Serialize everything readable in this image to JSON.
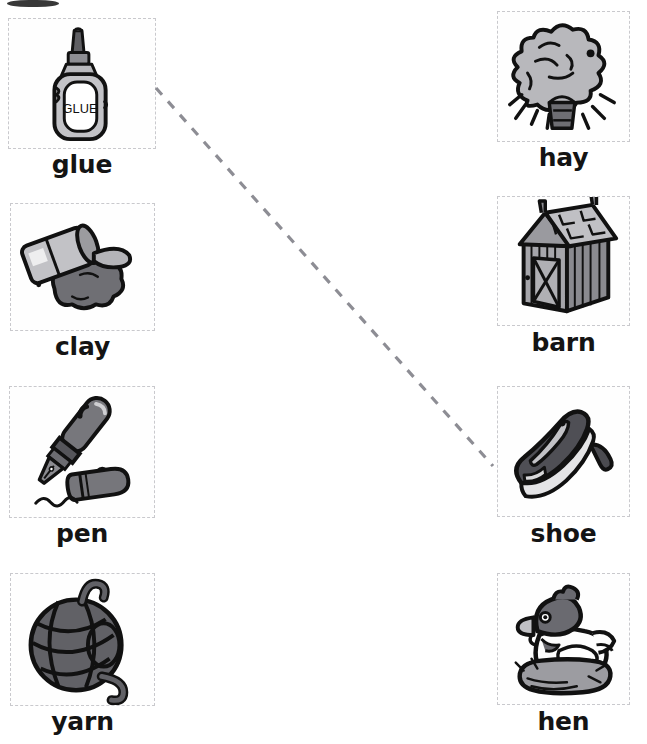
{
  "worksheet": {
    "title": "Matching worksheet: short vowel picture word match",
    "artifact": {
      "name": "scan-edge-artifact"
    },
    "columns": {
      "left": {
        "name": "left-column",
        "items": [
          {
            "word": "glue",
            "icon": "glue-bottle-icon",
            "box": {
              "x": 8,
              "y": 18,
              "w": 148,
              "h": 131
            },
            "label_y": 150
          },
          {
            "word": "clay",
            "icon": "clay-container-icon",
            "box": {
              "x": 10,
              "y": 203,
              "w": 145,
              "h": 128
            },
            "label_y": 332
          },
          {
            "word": "pen",
            "icon": "fountain-pen-icon",
            "box": {
              "x": 9,
              "y": 386,
              "w": 146,
              "h": 132
            },
            "label_y": 519
          },
          {
            "word": "yarn",
            "icon": "yarn-ball-icon",
            "box": {
              "x": 10,
              "y": 573,
              "w": 145,
              "h": 133
            },
            "label_y": 707
          }
        ]
      },
      "right": {
        "name": "right-column",
        "items": [
          {
            "word": "hay",
            "icon": "haystack-icon",
            "box": {
              "x": 497,
              "y": 11,
              "w": 133,
              "h": 131
            },
            "label_y": 143
          },
          {
            "word": "barn",
            "icon": "barn-icon",
            "box": {
              "x": 497,
              "y": 196,
              "w": 133,
              "h": 130
            },
            "label_y": 328
          },
          {
            "word": "shoe",
            "icon": "high-heel-shoe-icon",
            "box": {
              "x": 497,
              "y": 386,
              "w": 133,
              "h": 131
            },
            "label_y": 519
          },
          {
            "word": "hen",
            "icon": "hen-in-nest-icon",
            "box": {
              "x": 497,
              "y": 573,
              "w": 133,
              "h": 132
            },
            "label_y": 707
          }
        ]
      }
    },
    "connections": [
      {
        "name": "connector-glue-to-shoe",
        "from": "glue",
        "to": "shoe",
        "x1": 156,
        "y1": 88,
        "x2": 493,
        "y2": 466,
        "color": "#8d8d94",
        "style": "dashed"
      }
    ]
  }
}
